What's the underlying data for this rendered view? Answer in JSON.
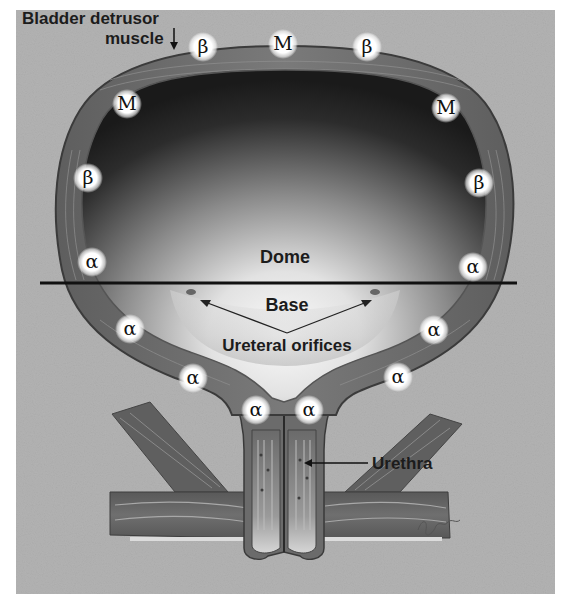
{
  "figure": {
    "colors": {
      "background_panel": "#b3b3b3",
      "wall": "#6e6e6e",
      "wall_dark": "#4a4a4a",
      "lumen_dark": "#1e1e1e",
      "lumen_light": "#f4f4f4",
      "divider": "#111111",
      "receptor_glow": "#ffffff"
    },
    "labels": {
      "detrusor_line1": "Bladder detrusor",
      "detrusor_line2": "muscle",
      "dome": "Dome",
      "base": "Base",
      "ureteral_orifices": "Ureteral orifices",
      "urethra": "Urethra"
    },
    "regions": [
      "Dome",
      "Base"
    ],
    "receptors": {
      "legend": {
        "M": "muscarinic",
        "β": "beta-adrenergic",
        "α": "alpha-adrenergic"
      },
      "dome": [
        "β",
        "M",
        "β",
        "M",
        "M",
        "β",
        "β",
        "α",
        "α"
      ],
      "base": [
        "α",
        "α",
        "α",
        "α",
        "α",
        "α"
      ],
      "markers": [
        {
          "id": "top-left-beta",
          "symbol": "β"
        },
        {
          "id": "top-center-m",
          "symbol": "M"
        },
        {
          "id": "top-right-beta",
          "symbol": "β"
        },
        {
          "id": "upper-left-m",
          "symbol": "M"
        },
        {
          "id": "upper-right-m",
          "symbol": "M"
        },
        {
          "id": "mid-left-beta",
          "symbol": "β"
        },
        {
          "id": "mid-right-beta",
          "symbol": "β"
        },
        {
          "id": "equator-left-alpha",
          "symbol": "α"
        },
        {
          "id": "equator-right-alpha",
          "symbol": "α"
        },
        {
          "id": "base-left-alpha-1",
          "symbol": "α"
        },
        {
          "id": "base-right-alpha-1",
          "symbol": "α"
        },
        {
          "id": "base-left-alpha-2",
          "symbol": "α"
        },
        {
          "id": "base-right-alpha-2",
          "symbol": "α"
        },
        {
          "id": "neck-left-alpha",
          "symbol": "α"
        },
        {
          "id": "neck-right-alpha",
          "symbol": "α"
        }
      ]
    },
    "signature": "artist signature"
  }
}
